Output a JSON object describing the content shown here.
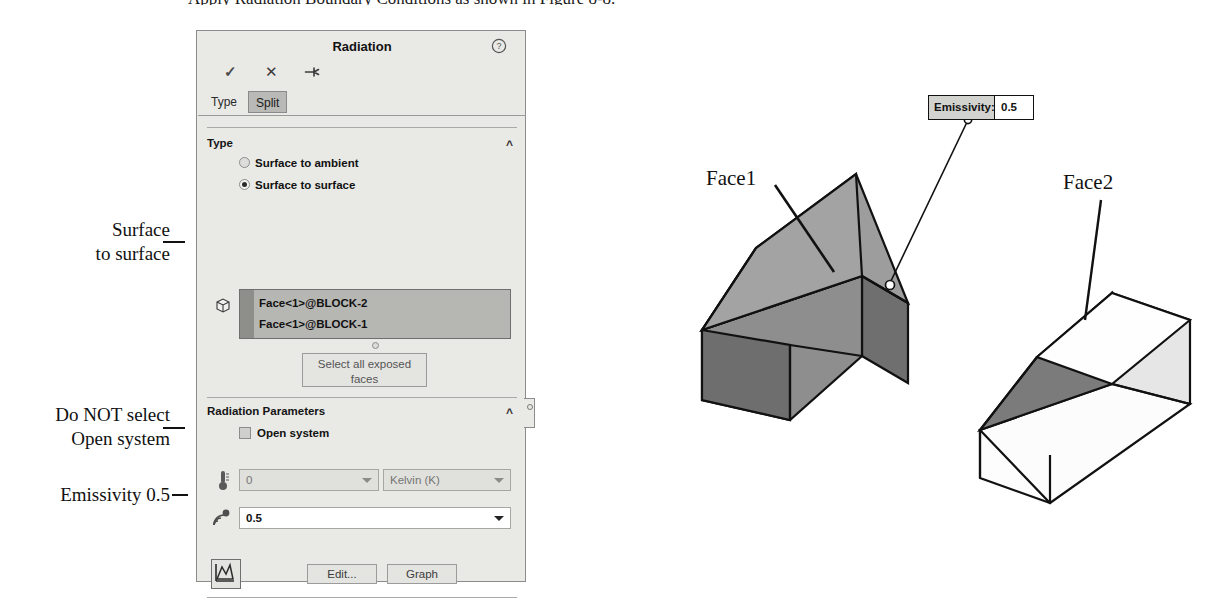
{
  "caption": "Apply Radiation Boundary Conditions as shown in Figure 8-8.",
  "panel": {
    "title": "Radiation",
    "help_icon": "question-mark-circle-icon",
    "toolbar": {
      "ok_icon": "checkmark-icon",
      "cancel_icon": "close-x-icon",
      "pin_icon": "push-pin-icon"
    },
    "tabs": [
      {
        "label": "Type",
        "active": true
      },
      {
        "label": "Split",
        "active": false
      }
    ],
    "type_section": {
      "header": "Type",
      "collapse_icon": "chevron-up-icon",
      "options": [
        {
          "label": "Surface to ambient",
          "selected": false
        },
        {
          "label": "Surface to surface",
          "selected": true
        }
      ],
      "selection_icon": "cube-face-icon",
      "selected_faces": [
        "Face<1>@BLOCK-2",
        "Face<1>@BLOCK-1"
      ],
      "select_all_button": "Select all exposed faces"
    },
    "radiation_parameters": {
      "header": "Radiation Parameters",
      "collapse_icon": "chevron-up-icon",
      "open_system": {
        "label": "Open system",
        "checked": false
      },
      "temperature": {
        "icon": "thermometer-icon",
        "value": "0",
        "disabled": true,
        "unit": "Kelvin (K)",
        "unit_disabled": true,
        "dropdown_icon": "chevron-down-icon"
      },
      "emissivity": {
        "icon": "radiation-emissivity-icon",
        "value": "0.5",
        "disabled": false,
        "dropdown_icon": "chevron-down-icon"
      },
      "graph_icon_button": "curve-graph-icon",
      "edit_button": "Edit...",
      "graph_button": "Graph"
    }
  },
  "annotations": [
    {
      "line1": "Surface",
      "line2": "to surface"
    },
    {
      "line1": "Do NOT select",
      "line2": "Open system"
    },
    {
      "line1": "Emissivity 0.5",
      "line2": ""
    }
  ],
  "drawing": {
    "face1_label": "Face1",
    "face2_label": "Face2",
    "callout": {
      "key": "Emissivity:",
      "value": "0.5"
    }
  },
  "colors": {
    "panel_bg": "#e9e9e6",
    "panel_border": "#8c8c8c",
    "selection_box": "#b6b6b3",
    "selection_strip": "#8e8e8b",
    "tab_inactive": "#b9b9b6",
    "field_disabled": "#e0e0dd",
    "field_enabled": "#ffffff",
    "block_face_mid": "#9e9e9e",
    "block_face_dark": "#767676",
    "block_face_light": "#b4b4b4",
    "block_face_white": "#fdfdfd",
    "callout_key_bg": "#d2d2cf",
    "ink": "#111111"
  }
}
